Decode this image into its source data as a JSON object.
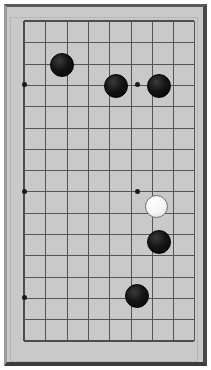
{
  "app": {
    "title": "Go Board",
    "description": "Cropped view of a Go (Baduk) board showing part of a game position"
  },
  "board": {
    "surface_color": "#c9c9c9",
    "line_color": "#555555",
    "frame_color": "#4a4a4a",
    "columns": 9,
    "rows": 16,
    "origin_x": 17,
    "origin_y": 14,
    "spacing": 21.3,
    "cropped": true
  },
  "grid": {
    "vertical_x": [
      17,
      38.3,
      59.6,
      80.9,
      102.2,
      123.5,
      144.8,
      166.1,
      187.4
    ],
    "horizontal_y": [
      14,
      35.3,
      56.6,
      77.9,
      99.2,
      120.5,
      141.8,
      163.1,
      184.4,
      205.7,
      227,
      248.3,
      269.6,
      290.9,
      312.2,
      333.5
    ]
  },
  "star_points": [
    {
      "name": "star-point-left-upper",
      "x": 17,
      "y": 77.9
    },
    {
      "name": "star-point-center-upper",
      "x": 130,
      "y": 77.9
    },
    {
      "name": "star-point-left-middle",
      "x": 17,
      "y": 184.4
    },
    {
      "name": "star-point-center-middle",
      "x": 130,
      "y": 184.4
    },
    {
      "name": "star-point-left-lower",
      "x": 17,
      "y": 290.9
    }
  ],
  "stones": [
    {
      "name": "stone-black-1",
      "color": "black",
      "x": 54,
      "y": 56.6,
      "diameter": 22,
      "label": "black stone"
    },
    {
      "name": "stone-black-2",
      "color": "black",
      "x": 108,
      "y": 77.9,
      "diameter": 22,
      "label": "black stone"
    },
    {
      "name": "stone-black-3",
      "color": "black",
      "x": 151,
      "y": 77.9,
      "diameter": 22,
      "label": "black stone"
    },
    {
      "name": "stone-white-1",
      "color": "white",
      "x": 148,
      "y": 198,
      "diameter": 21,
      "label": "white stone"
    },
    {
      "name": "stone-black-4",
      "color": "black",
      "x": 151,
      "y": 234,
      "diameter": 22,
      "label": "black stone"
    },
    {
      "name": "stone-black-5",
      "color": "black",
      "x": 129,
      "y": 288,
      "diameter": 22,
      "label": "black stone"
    }
  ],
  "colors": {
    "board": "#c9c9c9",
    "line": "#555555",
    "black_stone": "#0a0a0a",
    "white_stone": "#fafafa",
    "frame": "#4a4a4a"
  }
}
